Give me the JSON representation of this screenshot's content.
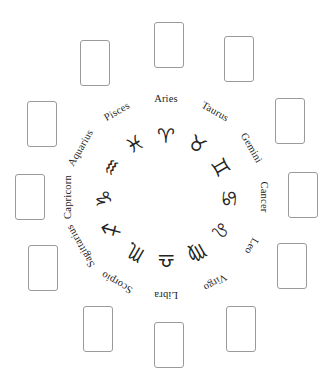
{
  "figure": {
    "width": 333,
    "height": 386,
    "background_color": "#ffffff",
    "text_color": "#1b1b1b",
    "card_border_color": "#9a9a9a"
  },
  "wheel": {
    "center_x": 166,
    "center_y": 197,
    "label_radius": 100,
    "glyph_radius": 62,
    "signs": [
      {
        "name": "Aries",
        "glyph": "♈",
        "angle_deg": 0,
        "glyph_angle_deg": 0
      },
      {
        "name": "Taurus",
        "glyph": "♉",
        "angle_deg": 30,
        "glyph_angle_deg": 30
      },
      {
        "name": "Gemini",
        "glyph": "♊",
        "angle_deg": 60,
        "glyph_angle_deg": 60
      },
      {
        "name": "Cancer",
        "glyph": "♋",
        "angle_deg": 90,
        "glyph_angle_deg": 90
      },
      {
        "name": "Leo",
        "glyph": "♌",
        "angle_deg": 120,
        "glyph_angle_deg": 120
      },
      {
        "name": "Virgo",
        "glyph": "♍",
        "angle_deg": 150,
        "glyph_angle_deg": 150
      },
      {
        "name": "Libra",
        "glyph": "♎",
        "angle_deg": 180,
        "glyph_angle_deg": 180
      },
      {
        "name": "Scorpio",
        "glyph": "♏",
        "angle_deg": 210,
        "glyph_angle_deg": 210
      },
      {
        "name": "Sagittarius",
        "glyph": "♐",
        "angle_deg": 240,
        "glyph_angle_deg": 240
      },
      {
        "name": "Capricorn",
        "glyph": "♑",
        "angle_deg": 270,
        "glyph_angle_deg": 270
      },
      {
        "name": "Aquarius",
        "glyph": "♒",
        "angle_deg": 300,
        "glyph_angle_deg": 300
      },
      {
        "name": "Pisces",
        "glyph": "♓",
        "angle_deg": 330,
        "glyph_angle_deg": 330
      }
    ]
  },
  "card_slots": [
    {
      "slot": "slot-12-oclock",
      "x": 154,
      "y": 22,
      "w": 30,
      "h": 46,
      "content": ""
    },
    {
      "slot": "slot-1-oclock",
      "x": 224,
      "y": 36,
      "w": 30,
      "h": 46,
      "content": ""
    },
    {
      "slot": "slot-2-oclock",
      "x": 275,
      "y": 98,
      "w": 30,
      "h": 46,
      "content": ""
    },
    {
      "slot": "slot-3-oclock",
      "x": 288,
      "y": 172,
      "w": 30,
      "h": 46,
      "content": ""
    },
    {
      "slot": "slot-4-oclock",
      "x": 277,
      "y": 243,
      "w": 30,
      "h": 46,
      "content": ""
    },
    {
      "slot": "slot-5-oclock",
      "x": 226,
      "y": 306,
      "w": 30,
      "h": 46,
      "content": ""
    },
    {
      "slot": "slot-6-oclock",
      "x": 154,
      "y": 322,
      "w": 30,
      "h": 46,
      "content": ""
    },
    {
      "slot": "slot-7-oclock",
      "x": 83,
      "y": 306,
      "w": 30,
      "h": 46,
      "content": ""
    },
    {
      "slot": "slot-8-oclock",
      "x": 28,
      "y": 245,
      "w": 30,
      "h": 46,
      "content": ""
    },
    {
      "slot": "slot-9-oclock",
      "x": 15,
      "y": 174,
      "w": 30,
      "h": 46,
      "content": ""
    },
    {
      "slot": "slot-10-oclock",
      "x": 27,
      "y": 101,
      "w": 30,
      "h": 46,
      "content": ""
    },
    {
      "slot": "slot-11-oclock",
      "x": 80,
      "y": 40,
      "w": 30,
      "h": 46,
      "content": ""
    }
  ]
}
